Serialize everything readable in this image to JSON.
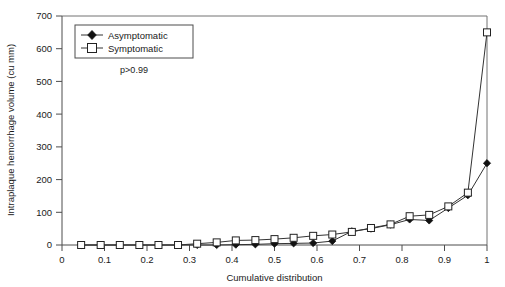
{
  "chart_data": {
    "type": "line",
    "title": "",
    "xlabel": "Cumulative distribution",
    "ylabel": "Intraplaque hemorrhage volume (cu mm)",
    "xlim": [
      0,
      1
    ],
    "ylim": [
      0,
      700
    ],
    "xticks": [
      0,
      0.1,
      0.2,
      0.3,
      0.4,
      0.5,
      0.6,
      0.7,
      0.8,
      0.9,
      1
    ],
    "xtick_labels": [
      "0",
      "0.1",
      "0.2",
      "0.3",
      "0.4",
      "0.5",
      "0.6",
      "0.7",
      "0.8",
      "0.9",
      "1"
    ],
    "yticks": [
      0,
      100,
      200,
      300,
      400,
      500,
      600,
      700
    ],
    "ytick_labels": [
      "0",
      "100",
      "200",
      "300",
      "400",
      "500",
      "600",
      "700"
    ],
    "grid": false,
    "legend_position": "top-left",
    "annotations": [
      {
        "text": "p>0.99",
        "x": 0.19,
        "y": 520
      }
    ],
    "series": [
      {
        "name": "Asymptomatic",
        "marker": "filled-diamond",
        "color": "#111111",
        "x": [
          0.045,
          0.091,
          0.136,
          0.182,
          0.227,
          0.273,
          0.318,
          0.364,
          0.409,
          0.455,
          0.5,
          0.545,
          0.591,
          0.636,
          0.682,
          0.727,
          0.773,
          0.818,
          0.864,
          0.909,
          0.955,
          1.0
        ],
        "y": [
          0,
          0,
          0,
          0,
          0,
          0,
          0,
          0,
          1,
          2,
          4,
          5,
          6,
          12,
          42,
          50,
          62,
          78,
          75,
          113,
          152,
          250
        ]
      },
      {
        "name": "Symptomatic",
        "marker": "open-square",
        "color": "#222222",
        "x": [
          0.045,
          0.091,
          0.136,
          0.182,
          0.227,
          0.273,
          0.318,
          0.364,
          0.409,
          0.455,
          0.5,
          0.545,
          0.591,
          0.636,
          0.682,
          0.727,
          0.773,
          0.818,
          0.864,
          0.909,
          0.955,
          1.0
        ],
        "y": [
          0,
          0,
          0,
          0,
          0,
          0,
          4,
          8,
          14,
          15,
          18,
          22,
          28,
          32,
          40,
          52,
          63,
          88,
          92,
          118,
          160,
          650
        ]
      }
    ]
  },
  "legend": {
    "items": [
      {
        "label": "Asymptomatic",
        "marker": "filled-diamond"
      },
      {
        "label": "Symptomatic",
        "marker": "open-square"
      }
    ]
  },
  "axes": {
    "x_title": "Cumulative distribution",
    "y_title": "Intraplaque hemorrhage volume (cu mm)"
  },
  "annotation": {
    "pvalue": "p>0.99"
  }
}
